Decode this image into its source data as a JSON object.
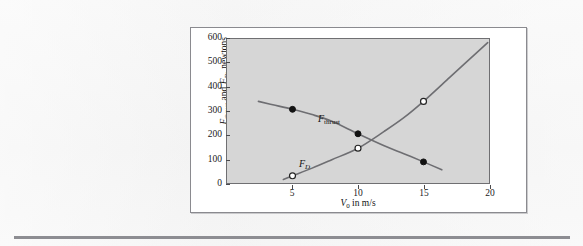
{
  "figure": {
    "panel_background": "#ffffff",
    "panel_border_color": "#8a8a8f",
    "plot_background": "#d6d6d6",
    "curve_color": "#6e6e72",
    "marker_filled_color": "#121212",
    "marker_open_color": "#ffffff"
  },
  "chart_data": {
    "type": "line",
    "title": "",
    "subtitle": "",
    "xlabel": "V0 in m/s",
    "xlabel_parts": {
      "symbol": "V",
      "subscript": "0",
      "rest": " in m/s"
    },
    "ylabel": "Fthrust and FD, newtons",
    "ylabel_parts": {
      "symbol1": "F",
      "subscript1": "thrust",
      "conjunction": " and ",
      "symbol2": "F",
      "subscript2": "D",
      "rest": ", newtons"
    },
    "xlim": [
      0,
      20
    ],
    "ylim": [
      0,
      600
    ],
    "xticks": [
      5,
      10,
      15,
      20
    ],
    "xtick_labels": [
      "5",
      "10",
      "15",
      "20"
    ],
    "yticks": [
      0,
      100,
      200,
      300,
      400,
      500,
      600
    ],
    "ytick_labels": [
      "0",
      "100",
      "200",
      "300",
      "400",
      "500",
      "600"
    ],
    "grid": false,
    "legend_position": "inline-annotations",
    "annotations": [
      {
        "id": "fthrust",
        "text": "Fthrust",
        "symbol": "F",
        "subscript": "thrust",
        "x": 8.1,
        "y": 262
      },
      {
        "id": "fd",
        "text": "FD",
        "symbol": "F",
        "subscript": "D",
        "x": 6.6,
        "y": 112
      }
    ],
    "series": [
      {
        "name": "Fthrust",
        "marker": "filled-circle",
        "line_color": "#6e6e72",
        "x": [
          2.4,
          3.5,
          5.0,
          6.5,
          8.0,
          10.0,
          12.0,
          13.5,
          15.0,
          16.4
        ],
        "y": [
          340,
          326,
          307,
          285,
          257,
          205,
          155,
          122,
          88,
          55
        ],
        "data_points": [
          {
            "x": 5,
            "y": 307
          },
          {
            "x": 10,
            "y": 205
          },
          {
            "x": 15,
            "y": 88
          }
        ]
      },
      {
        "name": "FD",
        "marker": "open-circle",
        "line_color": "#6e6e72",
        "x": [
          4.3,
          5.0,
          6.5,
          8.0,
          10.0,
          12.0,
          13.5,
          15.0,
          17.0,
          18.5,
          19.9
        ],
        "y": [
          15,
          30,
          62,
          97,
          145,
          215,
          272,
          340,
          440,
          515,
          585
        ],
        "data_points": [
          {
            "x": 5,
            "y": 30
          },
          {
            "x": 10,
            "y": 145
          },
          {
            "x": 15,
            "y": 340
          }
        ]
      }
    ]
  }
}
